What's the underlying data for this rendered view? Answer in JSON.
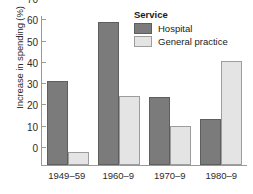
{
  "chart_data": {
    "type": "bar",
    "title": "",
    "xlabel": "",
    "ylabel": "Increase in spending (%)",
    "ylim": [
      0,
      70
    ],
    "yticks": [
      0,
      10,
      20,
      30,
      40,
      50,
      60,
      70
    ],
    "ytick_labels": [
      "0",
      "10",
      "20",
      "30",
      "40",
      "50",
      "60",
      "70"
    ],
    "grid": false,
    "legend_position": "top-right",
    "legend_title": "Service",
    "categories": [
      "1949‒59",
      "1960‒9",
      "1970‒9",
      "1980‒9"
    ],
    "series": [
      {
        "name": "Hospital",
        "color": "#7b7b7b",
        "values": [
          39.5,
          67,
          32,
          21.5
        ]
      },
      {
        "name": "General practice",
        "color": "#e4e4e4",
        "values": [
          6,
          32.5,
          18.5,
          49
        ]
      }
    ]
  },
  "legend": {
    "title": "Service",
    "items": [
      {
        "label": "Hospital"
      },
      {
        "label": "General practice"
      }
    ]
  },
  "caption": {
    "sliver_text": ""
  }
}
